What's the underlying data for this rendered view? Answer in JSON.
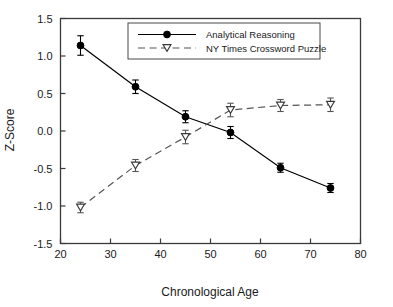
{
  "chart_data": {
    "type": "line",
    "title": "",
    "xlabel": "Chronological Age",
    "ylabel": "Z-Score",
    "xlim": [
      20,
      80
    ],
    "ylim": [
      -1.5,
      1.5
    ],
    "xticks": [
      20,
      30,
      40,
      50,
      60,
      70,
      80
    ],
    "xtick_labels": [
      "20",
      "30",
      "40",
      "50",
      "60",
      "70",
      "80"
    ],
    "yticks": [
      -1.5,
      -1.0,
      -0.5,
      0.0,
      0.5,
      1.0,
      1.5
    ],
    "ytick_labels": [
      "-1.5",
      "-1.0",
      "-0.5",
      "0.0",
      "0.5",
      "1.0",
      "1.5"
    ],
    "grid": false,
    "legend_position": "upper-center-right",
    "x": [
      24,
      35,
      45,
      54,
      64,
      74
    ],
    "series": [
      {
        "name": "Analytical Reasoning",
        "marker": "filled-circle",
        "linestyle": "solid",
        "color": "#000000",
        "values": [
          1.14,
          0.59,
          0.19,
          -0.02,
          -0.49,
          -0.76
        ],
        "errors": [
          0.13,
          0.09,
          0.08,
          0.08,
          0.06,
          0.06
        ]
      },
      {
        "name": "NY Times Crossword Puzzle",
        "marker": "open-down-triangle",
        "linestyle": "dashed",
        "color": "#555555",
        "values": [
          -1.02,
          -0.46,
          -0.08,
          0.28,
          0.34,
          0.35
        ],
        "errors": [
          0.07,
          0.08,
          0.09,
          0.09,
          0.08,
          0.09
        ]
      }
    ]
  },
  "legend": {
    "entries": [
      {
        "label": "Analytical Reasoning"
      },
      {
        "label": "NY Times Crossword Puzzle"
      }
    ]
  }
}
